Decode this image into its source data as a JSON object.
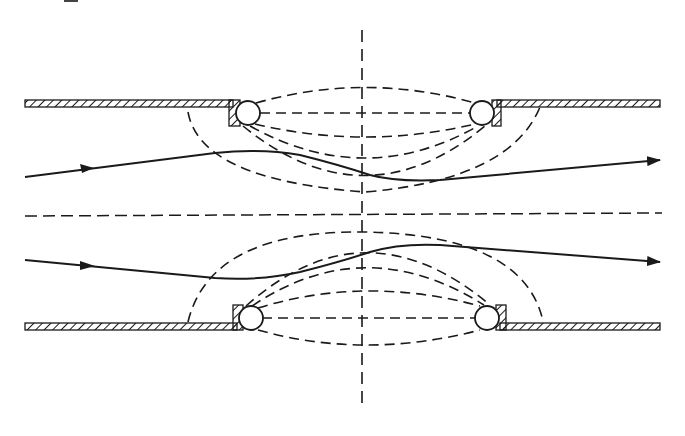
{
  "diagram": {
    "type": "flow-through-lens-gap",
    "colors": {
      "ink": "#1a1a1a",
      "background": "#ffffff"
    },
    "walls": [
      {
        "name": "top",
        "y": 103,
        "left_segment": [
          25,
          232
        ],
        "right_segment": [
          497,
          660
        ],
        "hatched": true
      },
      {
        "name": "bottom",
        "y": 326,
        "left_segment": [
          25,
          236
        ],
        "right_segment": [
          500,
          660
        ],
        "hatched": true
      }
    ],
    "rings": [
      {
        "cx": 248,
        "cy": 113,
        "r": 12
      },
      {
        "cx": 482,
        "cy": 113,
        "r": 12
      },
      {
        "cx": 251,
        "cy": 318,
        "r": 12
      },
      {
        "cx": 487,
        "cy": 318,
        "r": 12
      }
    ],
    "axes": {
      "horizontal_dashed_y": 216,
      "vertical_dashed_x": 362,
      "vertical_range": [
        30,
        405
      ]
    },
    "streamlines": [
      {
        "name": "upper",
        "direction": "left-to-right",
        "arrow_mid_x": 90,
        "arrow_end": [
          660,
          160
        ]
      },
      {
        "name": "lower",
        "direction": "left-to-right",
        "arrow_mid_x": 90,
        "arrow_end": [
          660,
          262
        ]
      }
    ],
    "corner_fragment": ""
  }
}
